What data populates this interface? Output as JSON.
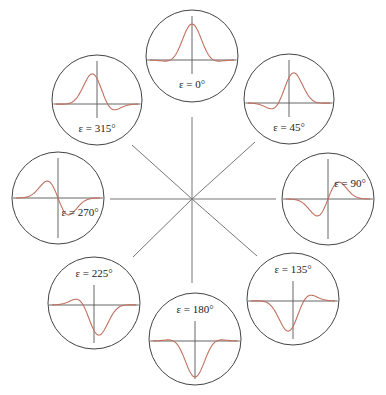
{
  "diagram": {
    "colors": {
      "background": "#ffffff",
      "axis_line": "#555555",
      "circle_stroke": "#444444",
      "curve": "#c0705f",
      "spoke": "#777777"
    },
    "hub": {
      "cx": 192,
      "cy": 199
    },
    "spokes": [
      {
        "name": "spoke-up",
        "x2": 192,
        "y2": 117
      },
      {
        "name": "spoke-down",
        "x2": 192,
        "y2": 283
      },
      {
        "name": "spoke-left",
        "x2": 110,
        "y2": 199
      },
      {
        "name": "spoke-right",
        "x2": 276,
        "y2": 199
      },
      {
        "name": "spoke-up-left",
        "x2": 132,
        "y2": 145
      },
      {
        "name": "spoke-up-right",
        "x2": 255,
        "y2": 142
      },
      {
        "name": "spoke-down-left",
        "x2": 133,
        "y2": 257
      },
      {
        "name": "spoke-down-right",
        "x2": 257,
        "y2": 256
      }
    ],
    "panels": [
      {
        "id": "eps-0",
        "label": "ε = 0°",
        "phase_deg": 0,
        "cx": 192,
        "cy": 56,
        "r": 46,
        "label_pos": "bottom"
      },
      {
        "id": "eps-45",
        "label": "ε = 45°",
        "phase_deg": 45,
        "cx": 289,
        "cy": 99,
        "r": 45,
        "label_pos": "bottom"
      },
      {
        "id": "eps-90",
        "label": "ε = 90°",
        "phase_deg": 90,
        "cx": 328,
        "cy": 199,
        "r": 46,
        "label_pos": "upper-right"
      },
      {
        "id": "eps-135",
        "label": "ε = 135°",
        "phase_deg": 135,
        "cx": 293,
        "cy": 299,
        "r": 46,
        "label_pos": "top"
      },
      {
        "id": "eps-180",
        "label": "ε = 180°",
        "phase_deg": 180,
        "cx": 195,
        "cy": 339,
        "r": 46,
        "label_pos": "top"
      },
      {
        "id": "eps-225",
        "label": "ε = 225°",
        "phase_deg": 225,
        "cx": 94,
        "cy": 303,
        "r": 46,
        "label_pos": "top"
      },
      {
        "id": "eps-270",
        "label": "ε = 270°",
        "phase_deg": 270,
        "cx": 58,
        "cy": 198,
        "r": 46,
        "label_pos": "lower-right"
      },
      {
        "id": "eps-315",
        "label": "ε = 315°",
        "phase_deg": 315,
        "cx": 97,
        "cy": 100,
        "r": 45,
        "label_pos": "bottom"
      }
    ]
  }
}
